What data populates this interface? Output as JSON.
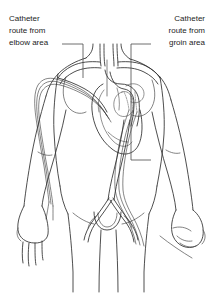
{
  "figure": {
    "background_color": "#ffffff",
    "line_color": "#3a3a3a",
    "text_color": "#1d1d1d"
  },
  "labels": {
    "left": {
      "name": "catheter-route-elbow",
      "line1": "Catheter",
      "line2": "route from",
      "line3": "elbow area",
      "align": "left",
      "x": 9,
      "y_line1": 21,
      "anchor_target": "left subclavian vessel at shoulder"
    },
    "right": {
      "name": "catheter-route-groin",
      "line1": "Catheter",
      "line2": "route from",
      "line3": "groin area",
      "align": "right",
      "x": 205,
      "y_line1": 21,
      "anchor_target": "descending aorta and right femoral artery"
    }
  },
  "anatomy": {
    "parts": [
      "neck",
      "left shoulder",
      "right shoulder",
      "chest",
      "heart",
      "aortic arch",
      "descending aorta",
      "iliac bifurcation",
      "left arm",
      "right arm",
      "left hand",
      "right hand",
      "pelvis",
      "left thigh",
      "right thigh"
    ]
  },
  "catheter_routes": [
    {
      "id": "elbow-route",
      "entry_site": "elbow area",
      "path_description": "up the left arm through the subclavian vein into the superior vena cava and down to the heart",
      "side": "left"
    },
    {
      "id": "groin-route",
      "entry_site": "groin area",
      "path_description": "up the right femoral and iliac artery through the descending aorta to the heart",
      "side": "right"
    }
  ]
}
